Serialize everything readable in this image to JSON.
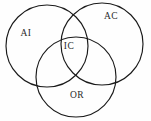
{
  "diagram": {
    "type": "venn",
    "title": "",
    "background_color": "#fefefe",
    "stroke_color": "#1a1a1a",
    "label_color": "#2a2a2a",
    "sets": [
      {
        "key": "ai",
        "label": "AI",
        "label_x": 26,
        "label_y": 34,
        "cx": 47,
        "cy": 46,
        "r": 41
      },
      {
        "key": "ac",
        "label": "AC",
        "label_x": 111,
        "label_y": 17,
        "cx": 102,
        "cy": 44,
        "r": 41
      },
      {
        "key": "or",
        "label": "OR",
        "label_x": 77,
        "label_y": 96,
        "cx": 76,
        "cy": 77,
        "r": 40
      }
    ],
    "intersections": [
      {
        "key": "ic",
        "label": "IC",
        "label_x": 69,
        "label_y": 47,
        "members": "AI AC OR"
      }
    ]
  }
}
